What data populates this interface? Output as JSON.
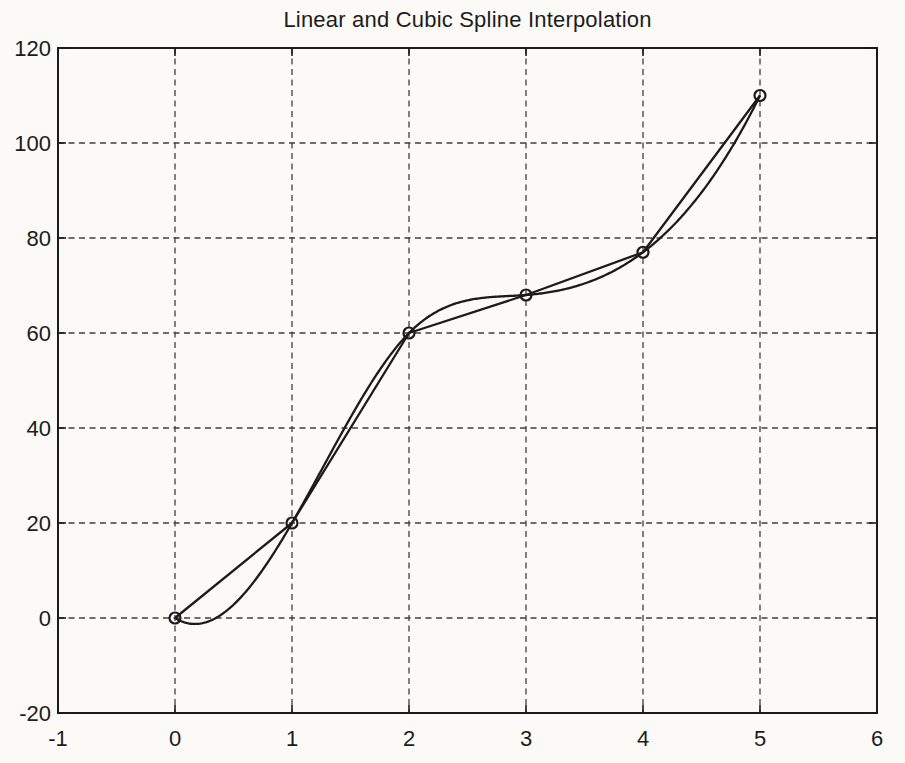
{
  "page": {
    "background": "#fbfaf6"
  },
  "chart_data": {
    "type": "line",
    "title": "Linear and Cubic Spline Interpolation",
    "x": [
      0,
      1,
      2,
      3,
      4,
      5
    ],
    "y": [
      0,
      20,
      60,
      68,
      77,
      110
    ],
    "series": [
      {
        "name": "linear-interpolation",
        "style": "piecewise-linear"
      },
      {
        "name": "cubic-spline-interpolation",
        "style": "cubic-spline-not-a-knot"
      },
      {
        "name": "data-points",
        "style": "open-circle-markers"
      }
    ],
    "xlim": [
      -1,
      6
    ],
    "ylim": [
      -20,
      120
    ],
    "xticks": [
      -1,
      0,
      1,
      2,
      3,
      4,
      5,
      6
    ],
    "yticks": [
      -20,
      0,
      20,
      40,
      60,
      80,
      100,
      120
    ],
    "grid": true,
    "grid_style": "dashed",
    "legend": "none",
    "colors": {
      "line": "#1b1b1b",
      "grid": "#3f3f3f",
      "axis": "#1b1b1b",
      "text": "#1c1c1c"
    }
  }
}
